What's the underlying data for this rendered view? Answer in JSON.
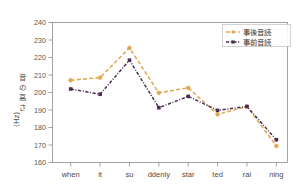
{
  "chart": {
    "type": "line",
    "title": "",
    "xlabel": "",
    "ylabel": "音の高さ (Hz)",
    "ylabel_parts": [
      "音",
      "の",
      "高",
      "さ",
      "(Hz)"
    ],
    "ylim": [
      160,
      240
    ],
    "ytick_step": 10,
    "yticks": [
      "240",
      "230",
      "220",
      "210",
      "200",
      "190",
      "180",
      "170",
      "160"
    ],
    "grid": false,
    "legend_position": "top-right"
  },
  "chart_data": {
    "type": "line",
    "title": "",
    "xlabel": "",
    "ylabel": "音の高さ (Hz)",
    "ylim": [
      160,
      240
    ],
    "yticks": [
      160,
      170,
      180,
      190,
      200,
      210,
      220,
      230,
      240
    ],
    "categories": [
      "when",
      "it",
      "su",
      "ddenly",
      "star",
      "ted",
      "rai",
      "ning"
    ],
    "grid": false,
    "legend_position": "top-right",
    "series": [
      {
        "name": "事後音読",
        "color": "#E0A84E",
        "linestyle": "dashed",
        "marker": "circle",
        "values": [
          207.0,
          208.5,
          225.5,
          199.8,
          202.7,
          187.5,
          192.0,
          169.5
        ]
      },
      {
        "name": "事前音読",
        "color": "#4C2E52",
        "linestyle": "dash-dot",
        "marker": "square",
        "values": [
          202.0,
          199.0,
          218.5,
          191.3,
          197.8,
          189.8,
          192.0,
          173.0
        ]
      }
    ]
  },
  "legend": {
    "items": [
      {
        "label": "事後音読",
        "color": "#E0A84E"
      },
      {
        "label": "事前音読",
        "color": "#4C2E52"
      }
    ]
  }
}
